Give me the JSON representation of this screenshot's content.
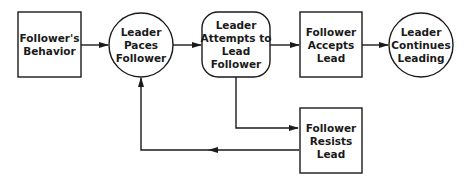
{
  "nodes": {
    "followers_behavior": {
      "lines": [
        "Follower's",
        "Behavior"
      ],
      "shape": "rectangle"
    },
    "leader_paces": {
      "lines": [
        "Leader",
        "Paces",
        "Follower"
      ],
      "shape": "circle"
    },
    "leader_attempts": {
      "lines": [
        "Leader",
        "Attempts to",
        "Lead",
        "Follower"
      ],
      "shape": "rounded-rectangle"
    },
    "follower_accepts": {
      "lines": [
        "Follower",
        "Accepts",
        "Lead"
      ],
      "shape": "rectangle"
    },
    "leader_continues": {
      "lines": [
        "Leader",
        "Continues",
        "Leading"
      ],
      "shape": "circle"
    },
    "follower_resists": {
      "lines": [
        "Follower",
        "Resists",
        "Lead"
      ],
      "shape": "rectangle"
    }
  },
  "edges": [
    {
      "from": "Follower's Behavior",
      "to": "Leader Paces Follower"
    },
    {
      "from": "Leader Paces Follower",
      "to": "Leader Attempts to Lead Follower"
    },
    {
      "from": "Leader Attempts to Lead Follower",
      "to": "Follower Accepts Lead"
    },
    {
      "from": "Follower Accepts Lead",
      "to": "Leader Continues Leading"
    },
    {
      "from": "Leader Attempts to Lead Follower",
      "to": "Follower Resists Lead"
    },
    {
      "from": "Follower Resists Lead",
      "to": "Leader Paces Follower"
    }
  ],
  "colors": {
    "stroke": "#1a1a1a",
    "background": "#ffffff"
  }
}
